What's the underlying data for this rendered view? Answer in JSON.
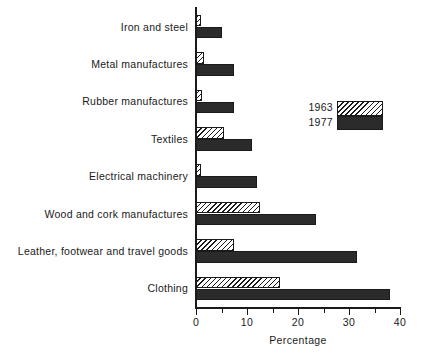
{
  "chart_data": {
    "type": "bar",
    "orientation": "horizontal",
    "title": "",
    "xlabel": "Percentage",
    "ylabel": "",
    "xlim": [
      0,
      40
    ],
    "xticks": [
      0,
      10,
      20,
      30,
      40
    ],
    "xtick_labels": [
      "0",
      "10",
      "20",
      "30",
      "40"
    ],
    "xminor_ticks": [
      5,
      15,
      25,
      35
    ],
    "grid": false,
    "legend_position": "upper-right",
    "categories": [
      "Iron and steel",
      "Metal manufactures",
      "Rubber manufactures",
      "Textiles",
      "Electrical machinery",
      "Wood and cork manufactures",
      "Leather, footwear and travel goods",
      "Clothing"
    ],
    "series": [
      {
        "name": "1963",
        "fill": "hatched",
        "values": [
          1.0,
          1.5,
          1.2,
          5.5,
          1.0,
          12.5,
          7.5,
          16.5
        ]
      },
      {
        "name": "1977",
        "fill": "solid",
        "values": [
          5.0,
          7.5,
          7.5,
          11.0,
          12.0,
          23.5,
          31.5,
          38.0
        ]
      }
    ]
  },
  "legend": {
    "entries": [
      {
        "label": "1963"
      },
      {
        "label": "1977"
      }
    ]
  },
  "colors": {
    "ink": "#1a1a1a",
    "solid_bar": "#2b2b2b",
    "background": "#ffffff"
  }
}
